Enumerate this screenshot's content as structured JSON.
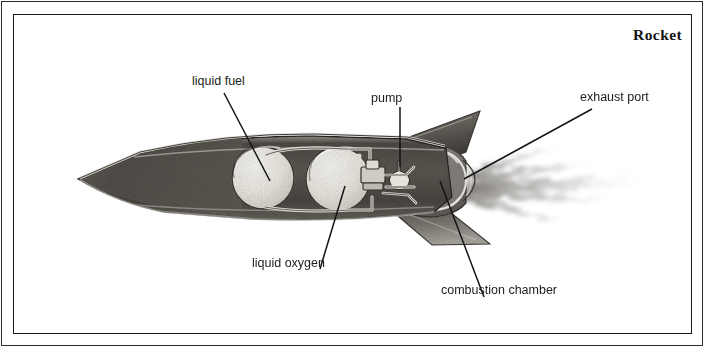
{
  "figure": {
    "title": "Rocket",
    "kind": "pencil-drawn cutaway diagram",
    "border_color": "#1a1a1a",
    "background_color": "#ffffff"
  },
  "labels": {
    "liquid_fuel": "liquid fuel",
    "pump": "pump",
    "exhaust_port": "exhaust port",
    "liquid_oxygen": "liquid oxygen",
    "combustion_chamber": "combustion chamber"
  },
  "parts": [
    {
      "name": "nose-cone",
      "label": ""
    },
    {
      "name": "liquid-fuel-tank",
      "label": "liquid fuel"
    },
    {
      "name": "liquid-oxygen-tank",
      "label": "liquid oxygen"
    },
    {
      "name": "pump-assembly",
      "label": "pump"
    },
    {
      "name": "combustion-chamber",
      "label": "combustion chamber"
    },
    {
      "name": "exhaust-port",
      "label": "exhaust port"
    },
    {
      "name": "upper-fin",
      "label": ""
    },
    {
      "name": "lower-fin",
      "label": ""
    },
    {
      "name": "exhaust-plume",
      "label": ""
    }
  ],
  "colors": {
    "body_shade": "#55514d",
    "body_shade_light": "#6e6a65",
    "tank_fill": "#eceae4",
    "highlight": "#d8d5cf",
    "outline": "#2a2724",
    "plume": "#8d8a86",
    "leader_line": "#141414"
  }
}
